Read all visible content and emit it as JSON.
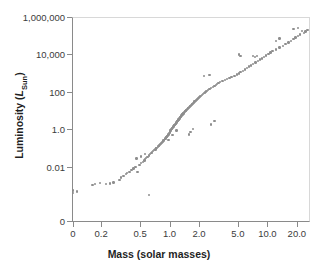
{
  "chart_data": {
    "type": "scatter",
    "title": "",
    "xlabel": "Mass (solar masses)",
    "ylabel": "Luminosity (LSun)",
    "ylabel_parts": {
      "main": "Luminosity (",
      "italic": "L",
      "sub": "Sun",
      "close": ")"
    },
    "xscale": "log",
    "yscale": "log",
    "grid": false,
    "legend": null,
    "xticks": [
      0,
      0.2,
      0.5,
      1.0,
      2.0,
      5.0,
      10.0,
      20.0
    ],
    "xticklabels": [
      "0",
      "0.2",
      "0.5",
      "1.0",
      "2.0",
      "5.0",
      "10.0",
      "20.0"
    ],
    "yticks": [
      0,
      0.01,
      1.0,
      100,
      10000,
      1000000
    ],
    "yticklabels": [
      "0",
      "0.01",
      "1.0",
      "100",
      "10,000",
      "1,000,000"
    ],
    "xlim": [
      0.08,
      30
    ],
    "ylim": [
      0.0001,
      1000000
    ],
    "marker": {
      "color": "#8e8e8e",
      "size": 2.4,
      "shape": "circle"
    },
    "points": [
      [
        0.1,
        0.00045
      ],
      [
        0.1,
        0.0006
      ],
      [
        0.11,
        0.00052
      ],
      [
        0.16,
        0.0012
      ],
      [
        0.17,
        0.0013
      ],
      [
        0.19,
        0.0015
      ],
      [
        0.22,
        0.0013
      ],
      [
        0.24,
        0.0014
      ],
      [
        0.26,
        0.0016
      ],
      [
        0.3,
        0.0022
      ],
      [
        0.31,
        0.003
      ],
      [
        0.33,
        0.0035
      ],
      [
        0.35,
        0.0045
      ],
      [
        0.36,
        0.005
      ],
      [
        0.38,
        0.006
      ],
      [
        0.4,
        0.0075
      ],
      [
        0.42,
        0.009
      ],
      [
        0.44,
        0.011
      ],
      [
        0.46,
        0.006
      ],
      [
        0.48,
        0.014
      ],
      [
        0.5,
        0.017
      ],
      [
        0.52,
        0.02
      ],
      [
        0.54,
        0.024
      ],
      [
        0.55,
        0.028
      ],
      [
        0.56,
        0.033
      ],
      [
        0.58,
        0.038
      ],
      [
        0.6,
        0.045
      ],
      [
        0.6,
        0.00035
      ],
      [
        0.62,
        0.052
      ],
      [
        0.64,
        0.06
      ],
      [
        0.65,
        0.068
      ],
      [
        0.66,
        0.075
      ],
      [
        0.68,
        0.085
      ],
      [
        0.7,
        0.095
      ],
      [
        0.71,
        0.105
      ],
      [
        0.72,
        0.115
      ],
      [
        0.74,
        0.13
      ],
      [
        0.75,
        0.14
      ],
      [
        0.76,
        0.15
      ],
      [
        0.78,
        0.17
      ],
      [
        0.8,
        0.19
      ],
      [
        0.81,
        0.21
      ],
      [
        0.82,
        0.23
      ],
      [
        0.84,
        0.25
      ],
      [
        0.85,
        0.28
      ],
      [
        0.86,
        0.3
      ],
      [
        0.88,
        0.33
      ],
      [
        0.89,
        0.36
      ],
      [
        0.9,
        0.4
      ],
      [
        0.91,
        0.43
      ],
      [
        0.92,
        0.47
      ],
      [
        0.93,
        0.5
      ],
      [
        0.94,
        0.55
      ],
      [
        0.95,
        0.6
      ],
      [
        0.96,
        0.64
      ],
      [
        0.97,
        0.7
      ],
      [
        0.98,
        0.75
      ],
      [
        0.99,
        0.82
      ],
      [
        1.0,
        0.9
      ],
      [
        1.0,
        1.0
      ],
      [
        1.01,
        1.05
      ],
      [
        1.02,
        1.12
      ],
      [
        1.03,
        1.2
      ],
      [
        1.04,
        1.28
      ],
      [
        1.05,
        1.35
      ],
      [
        1.06,
        1.45
      ],
      [
        1.07,
        1.55
      ],
      [
        1.08,
        1.65
      ],
      [
        1.09,
        1.75
      ],
      [
        1.1,
        1.85
      ],
      [
        1.11,
        1.95
      ],
      [
        1.12,
        2.1
      ],
      [
        1.13,
        2.25
      ],
      [
        1.14,
        2.4
      ],
      [
        1.15,
        2.55
      ],
      [
        1.16,
        2.7
      ],
      [
        1.17,
        2.9
      ],
      [
        1.18,
        3.1
      ],
      [
        1.19,
        3.3
      ],
      [
        1.2,
        3.5
      ],
      [
        1.21,
        3.7
      ],
      [
        1.22,
        3.95
      ],
      [
        1.23,
        4.2
      ],
      [
        1.24,
        4.5
      ],
      [
        1.25,
        4.8
      ],
      [
        1.26,
        5.1
      ],
      [
        1.27,
        5.4
      ],
      [
        1.28,
        5.8
      ],
      [
        1.29,
        6.2
      ],
      [
        1.3,
        6.6
      ],
      [
        1.32,
        7.0
      ],
      [
        1.33,
        7.5
      ],
      [
        1.35,
        8.0
      ],
      [
        1.36,
        8.6
      ],
      [
        1.38,
        9.2
      ],
      [
        1.4,
        9.8
      ],
      [
        1.42,
        10.5
      ],
      [
        1.44,
        11.5
      ],
      [
        1.46,
        12.5
      ],
      [
        1.48,
        13.5
      ],
      [
        1.5,
        14.5
      ],
      [
        1.52,
        15.5
      ],
      [
        1.55,
        17.0
      ],
      [
        1.58,
        18.5
      ],
      [
        1.6,
        20.0
      ],
      [
        1.62,
        22.0
      ],
      [
        1.65,
        24.0
      ],
      [
        1.68,
        26.0
      ],
      [
        1.7,
        28.0
      ],
      [
        1.73,
        31.0
      ],
      [
        1.76,
        34.0
      ],
      [
        1.8,
        37.0
      ],
      [
        1.83,
        40.0
      ],
      [
        1.86,
        44.0
      ],
      [
        1.9,
        48.0
      ],
      [
        1.93,
        53.0
      ],
      [
        1.96,
        58.0
      ],
      [
        2.0,
        64.0
      ],
      [
        2.05,
        70.0
      ],
      [
        2.1,
        78.0
      ],
      [
        2.15,
        86.0
      ],
      [
        2.2,
        95.0
      ],
      [
        2.25,
        105
      ],
      [
        2.3,
        115
      ],
      [
        2.35,
        128
      ],
      [
        2.4,
        140
      ],
      [
        2.5,
        160
      ],
      [
        2.6,
        180
      ],
      [
        2.7,
        205
      ],
      [
        2.8,
        230
      ],
      [
        2.9,
        260
      ],
      [
        3.0,
        290
      ],
      [
        3.1,
        330
      ],
      [
        3.2,
        370
      ],
      [
        3.4,
        420
      ],
      [
        2.2,
        800
      ],
      [
        2.5,
        900
      ],
      [
        3.6,
        480
      ],
      [
        3.8,
        550
      ],
      [
        4.0,
        620
      ],
      [
        4.2,
        700
      ],
      [
        4.5,
        820
      ],
      [
        4.8,
        950
      ],
      [
        5.0,
        1100
      ],
      [
        5.2,
        1300
      ],
      [
        5.5,
        1500
      ],
      [
        5.0,
        11000
      ],
      [
        5.2,
        9000
      ],
      [
        5.8,
        1800
      ],
      [
        6.0,
        2100
      ],
      [
        6.3,
        2500
      ],
      [
        6.6,
        2900
      ],
      [
        7.0,
        3500
      ],
      [
        7.4,
        4200
      ],
      [
        7.0,
        9500
      ],
      [
        7.3,
        8000
      ],
      [
        7.6,
        9000
      ],
      [
        7.8,
        5000
      ],
      [
        8.2,
        6000
      ],
      [
        8.6,
        7000
      ],
      [
        9.0,
        8500
      ],
      [
        9.5,
        10000
      ],
      [
        10.0,
        12000
      ],
      [
        10.5,
        14000
      ],
      [
        11.0,
        17000
      ],
      [
        12.0,
        21000
      ],
      [
        12.0,
        60000
      ],
      [
        13.0,
        80000
      ],
      [
        13.0,
        26000
      ],
      [
        14.0,
        32000
      ],
      [
        15.0,
        40000
      ],
      [
        16.0,
        48000
      ],
      [
        17.0,
        60000
      ],
      [
        18.0,
        75000
      ],
      [
        19.0,
        90000
      ],
      [
        20.0,
        110000
      ],
      [
        21.0,
        130000
      ],
      [
        18.0,
        250000
      ],
      [
        20.0,
        300000
      ],
      [
        22.0,
        200000
      ],
      [
        23.0,
        160000
      ],
      [
        24.0,
        190000
      ],
      [
        25.0,
        230000
      ],
      [
        1.55,
        0.6
      ],
      [
        1.6,
        0.8
      ],
      [
        1.7,
        1.2
      ],
      [
        0.95,
        0.3
      ],
      [
        1.05,
        0.55
      ],
      [
        1.15,
        0.95
      ],
      [
        2.6,
        2.0
      ],
      [
        2.8,
        3.0
      ],
      [
        0.45,
        0.03
      ],
      [
        0.5,
        0.04
      ],
      [
        0.55,
        0.055
      ]
    ]
  }
}
